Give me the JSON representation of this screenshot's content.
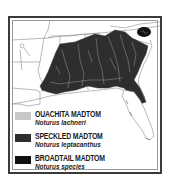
{
  "map": {
    "title": "Madtom distribution map",
    "region": "Southeastern United States",
    "colors": {
      "land": "#ffffff",
      "border_lines": "#8a8a8a",
      "speckled_range": "#2e2e2e",
      "broadtail_range": "#111111",
      "ouachita_range": "#c8c8c8",
      "rivers": "#9a9a9a"
    }
  },
  "legend": {
    "items": [
      {
        "common_name": "OUACHITA MADTOM",
        "scientific_name": "Noturus lachneri",
        "color": "#c8c8c8"
      },
      {
        "common_name": "SPECKLED MADTOM",
        "scientific_name": "Noturus leptacanthus",
        "color": "#2e2e2e"
      },
      {
        "common_name": "BROADTAIL MADTOM",
        "scientific_name": "Noturus species",
        "color": "#111111"
      }
    ]
  }
}
